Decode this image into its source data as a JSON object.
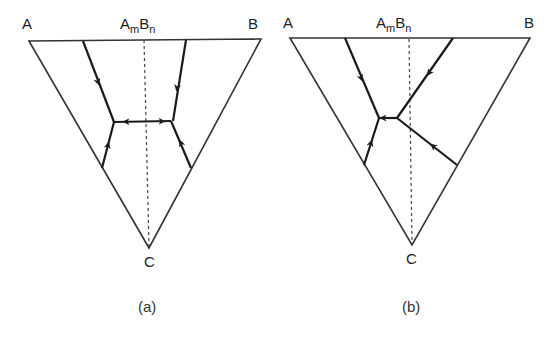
{
  "figure": {
    "panels": [
      {
        "id": "a",
        "caption": "(a)",
        "vertices": {
          "A": "A",
          "B": "B",
          "C": "C"
        },
        "compound": {
          "base1": "A",
          "sub1": "m",
          "base2": "B",
          "sub2": "n"
        },
        "description": "Ternary phase diagram A-B-C with congruent compound AmBn; boundary curves meet in two ternary eutectics separated by a saddle point on the join AmBn-C"
      },
      {
        "id": "b",
        "caption": "(b)",
        "vertices": {
          "A": "A",
          "B": "B",
          "C": "C"
        },
        "compound": {
          "base1": "A",
          "sub1": "m",
          "base2": "B",
          "sub2": "n"
        },
        "description": "Ternary phase diagram A-B-C with incongruent compound AmBn; peritectic point lies on the B side of the join, eutectic on the A side"
      }
    ],
    "colors": {
      "line": "#1a1a1a",
      "triangle": "#333333",
      "dashed": "#444444",
      "background": "#ffffff"
    }
  }
}
